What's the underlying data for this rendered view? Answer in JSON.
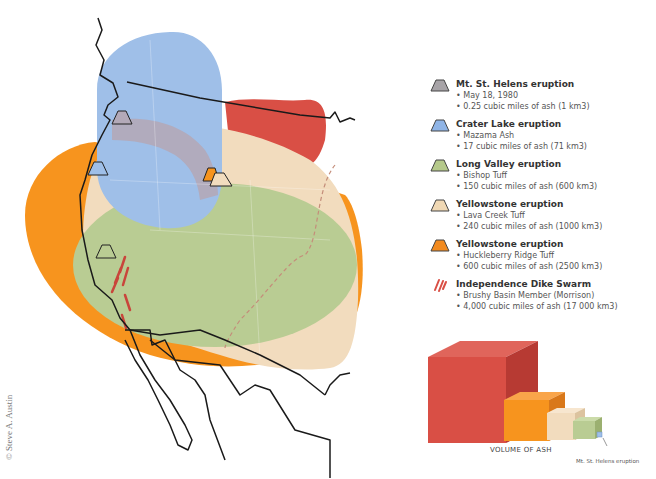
{
  "map": {
    "colors": {
      "mt_st_helens": "#b3a9b8",
      "crater_lake": "#9fbfe8",
      "long_valley": "#b9cc93",
      "lava_creek": "#f2dcbe",
      "huckleberry_ridge": "#f7941e",
      "independence_dike": "#d94f45",
      "coastline": "#1a1a1a"
    }
  },
  "legend": {
    "items": [
      {
        "icon": "volcano-icon-gray",
        "color": "#a8a4a8",
        "title": "Mt. St. Helens eruption",
        "lines": [
          "• May 18, 1980",
          "• 0.25 cubic miles of ash (1 km3)"
        ]
      },
      {
        "icon": "volcano-icon-blue",
        "color": "#8fb4e6",
        "title": "Crater Lake eruption",
        "lines": [
          "• Mazama Ash",
          "• 17 cubic miles of ash (71 km3)"
        ]
      },
      {
        "icon": "volcano-icon-green",
        "color": "#b5c98a",
        "title": "Long Valley eruption",
        "lines": [
          "• Bishop Tuff",
          "• 150 cubic miles of ash (600 km3)"
        ]
      },
      {
        "icon": "volcano-icon-tan",
        "color": "#f0d8b4",
        "title": "Yellowstone eruption",
        "lines": [
          "• Lava Creek Tuff",
          "• 240 cubic miles of ash (1000 km3)"
        ]
      },
      {
        "icon": "volcano-icon-orange",
        "color": "#f28a1e",
        "title": "Yellowstone eruption",
        "lines": [
          "• Huckleberry Ridge Tuff",
          "• 600 cubic miles of ash (2500 km3)"
        ]
      },
      {
        "icon": "dike-swarm-icon",
        "color": "#d94f45",
        "title": "Independence Dike Swarm",
        "lines": [
          "• Brushy Basin Member (Morrison)",
          "• 4,000 cubic miles of ash (17 000 km3)"
        ]
      }
    ]
  },
  "volume_graphic": {
    "axis_label": "VOLUME OF ASH",
    "pointer_label": "Mt. St. Helens eruption"
  },
  "credit": "© Steve A. Austin"
}
